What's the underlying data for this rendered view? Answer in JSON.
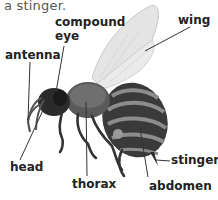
{
  "caption": "a stinger.",
  "labels": {
    "compound_eye_line1": "compound",
    "compound_eye_line2": "eye",
    "wing": "wing",
    "antenna": "antenna",
    "head": "head",
    "thorax": "thorax",
    "abdomen": "abdomen",
    "stinger": "stinger"
  },
  "colors": {
    "label_text": "#222222",
    "caption_text": "#555555",
    "leader_line": "#333333",
    "body_dark": "#2a2a2a",
    "body_mid": "#6a6a6a",
    "band_light": "#9a9a9a",
    "wing_fill": "#e4e4e4"
  }
}
